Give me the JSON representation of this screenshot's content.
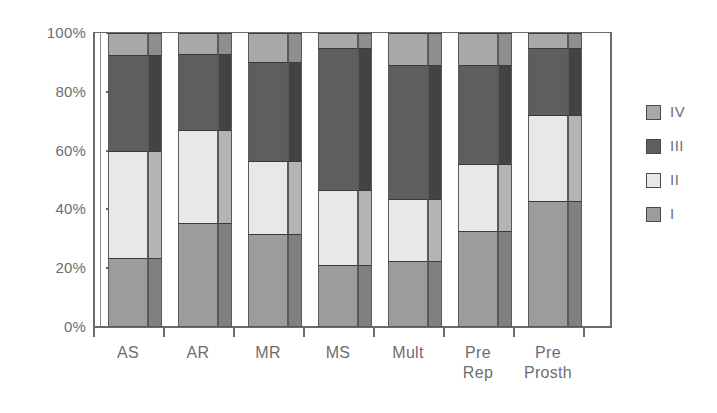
{
  "chart_data": {
    "type": "bar",
    "subtype": "stacked-100-percent",
    "title": "",
    "subtitle": "",
    "xlabel": "",
    "ylabel": "",
    "ylim": [
      0,
      100
    ],
    "yticks": [
      "0%",
      "20%",
      "40%",
      "60%",
      "80%",
      "100%"
    ],
    "ytick_values": [
      0,
      20,
      40,
      60,
      80,
      100
    ],
    "grid": false,
    "legend_position": "right",
    "categories": [
      "AS",
      "AR",
      "MR",
      "MS",
      "Mult",
      "Pre Rep",
      "Pre Prosth"
    ],
    "category_lines": [
      [
        "AS"
      ],
      [
        "AR"
      ],
      [
        "MR"
      ],
      [
        "MS"
      ],
      [
        "Mult"
      ],
      [
        "Pre",
        "Rep"
      ],
      [
        "Pre",
        "Prosth"
      ]
    ],
    "series": [
      {
        "name": "I",
        "color": "#9c9c9e",
        "side_color": "#808082",
        "values": [
          23.5,
          35.5,
          31.5,
          21.0,
          22.5,
          32.5,
          43.0
        ]
      },
      {
        "name": "II",
        "color": "#e8e8e8",
        "side_color": "#b4b4b6",
        "values": [
          36.5,
          31.5,
          25.0,
          25.5,
          21.0,
          23.0,
          29.0
        ]
      },
      {
        "name": "III",
        "color": "#5e5e60",
        "side_color": "#434345",
        "values": [
          32.5,
          26.0,
          33.5,
          48.5,
          45.5,
          33.5,
          23.0
        ]
      },
      {
        "name": "IV",
        "color": "#a8a8aa",
        "side_color": "#8e8e90",
        "values": [
          7.5,
          7.0,
          10.0,
          5.0,
          11.0,
          11.0,
          5.0
        ]
      }
    ],
    "cumulative_tops": {
      "AS": [
        23.5,
        60.0,
        92.5,
        100.0
      ],
      "AR": [
        35.5,
        67.0,
        93.0,
        100.0
      ],
      "MR": [
        31.5,
        56.5,
        90.0,
        100.0
      ],
      "MS": [
        21.0,
        46.5,
        95.0,
        100.0
      ],
      "Mult": [
        22.5,
        43.5,
        89.0,
        100.0
      ],
      "Pre Rep": [
        32.5,
        55.5,
        89.0,
        100.0
      ],
      "Pre Prosth": [
        43.0,
        72.0,
        95.0,
        100.0
      ]
    }
  },
  "legend": {
    "entries": [
      {
        "label": "IV",
        "color": "#a8a8aa"
      },
      {
        "label": "III",
        "color": "#5e5e60"
      },
      {
        "label": "II",
        "color": "#e8e8e8"
      },
      {
        "label": "I",
        "color": "#9c9c9e"
      }
    ]
  },
  "colors": {
    "axis": "#6a6a6c",
    "text": "#6e6e70",
    "background": "#ffffff",
    "series_I": "#9c9c9e",
    "series_II": "#e8e8e8",
    "series_III": "#5e5e60",
    "series_IV": "#a8a8aa"
  }
}
